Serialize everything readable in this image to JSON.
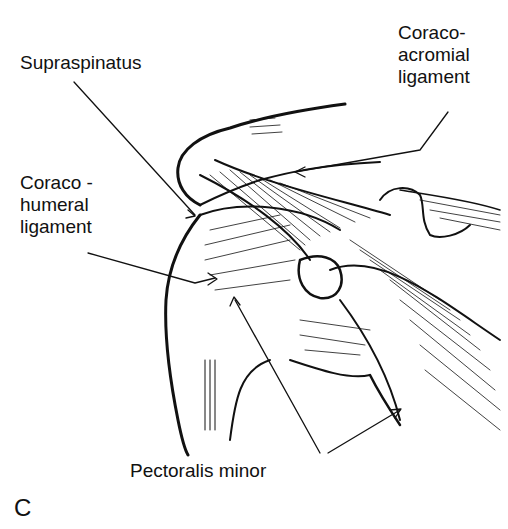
{
  "figure": {
    "panel_letter": "C",
    "labels": {
      "supraspinatus": "Supraspinatus",
      "coracoacromial": [
        "Coraco-",
        "acromial",
        "ligament"
      ],
      "coracohumeral": [
        "Coraco -",
        "humeral",
        "ligament"
      ],
      "pectoralis_minor": "Pectoralis minor"
    }
  }
}
